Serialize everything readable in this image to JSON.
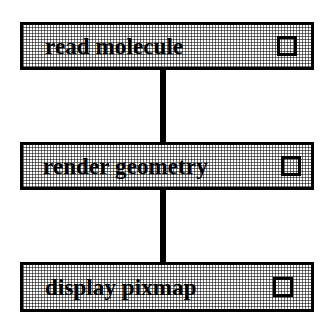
{
  "diagram": {
    "type": "vertical-pipeline",
    "orientation": "top-to-bottom",
    "stages": [
      {
        "label": "read molecule",
        "checkbox_state": "unchecked",
        "checkbox_icon": "empty-square-icon"
      },
      {
        "label": "render geometry",
        "checkbox_state": "unchecked",
        "checkbox_icon": "empty-square-icon"
      },
      {
        "label": "display pixmap",
        "checkbox_state": "unchecked",
        "checkbox_icon": "empty-square-icon"
      }
    ],
    "connectors": [
      {
        "from": "read molecule",
        "to": "render geometry"
      },
      {
        "from": "render geometry",
        "to": "display pixmap"
      }
    ],
    "colors": {
      "border": "#000000",
      "connector": "#000000",
      "text": "#000000",
      "box_fill": "#ffffff",
      "stipple": "#000000",
      "background": "#ffffff"
    }
  }
}
